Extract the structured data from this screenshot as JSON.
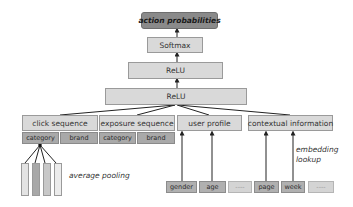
{
  "diagram": {
    "output": "action probabilities",
    "layers": [
      "Softmax",
      "ReLU",
      "ReLU"
    ],
    "inputs": [
      {
        "label": "click sequence",
        "sub": [
          "category",
          "brand"
        ]
      },
      {
        "label": "exposure sequence",
        "sub": [
          "category",
          "brand"
        ]
      },
      {
        "label": "user profile",
        "sub": []
      },
      {
        "label": "contextual information",
        "sub": []
      }
    ],
    "features": [
      "gender",
      "age",
      "----",
      "page",
      "week",
      "----"
    ],
    "annotations": {
      "pooling": "average pooling",
      "embedding_line1": "embedding",
      "embedding_line2": "lookup"
    },
    "pool_bar_colors": [
      "#e3e3e3",
      "#a8a8a8",
      "#c8c8c8",
      "#ececec"
    ]
  }
}
